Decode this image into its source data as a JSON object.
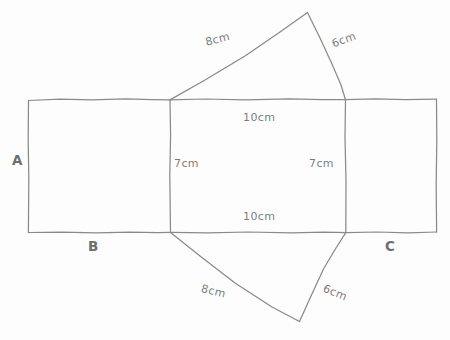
{
  "diagram": {
    "type": "geometric-net",
    "colors": {
      "stroke": "#8a8a8a",
      "text": "#7d7d7d",
      "label": "#6e6e6e",
      "background": "#fdfdfd"
    },
    "face_labels": [
      {
        "id": "A",
        "text": "A"
      },
      {
        "id": "B",
        "text": "B"
      },
      {
        "id": "C",
        "text": "C"
      }
    ],
    "dimensions": [
      {
        "id": "top-triangle-left",
        "text": "8cm",
        "rotation": -14
      },
      {
        "id": "top-triangle-right",
        "text": "6cm",
        "rotation": -20
      },
      {
        "id": "middle-rect-top",
        "text": "10cm",
        "rotation": 0
      },
      {
        "id": "middle-rect-left",
        "text": "7cm",
        "rotation": 0
      },
      {
        "id": "middle-rect-right",
        "text": "7cm",
        "rotation": 0
      },
      {
        "id": "middle-rect-bottom",
        "text": "10cm",
        "rotation": 0
      },
      {
        "id": "bottom-triangle-left",
        "text": "8cm",
        "rotation": 14
      },
      {
        "id": "bottom-triangle-right",
        "text": "6cm",
        "rotation": 22
      }
    ]
  }
}
